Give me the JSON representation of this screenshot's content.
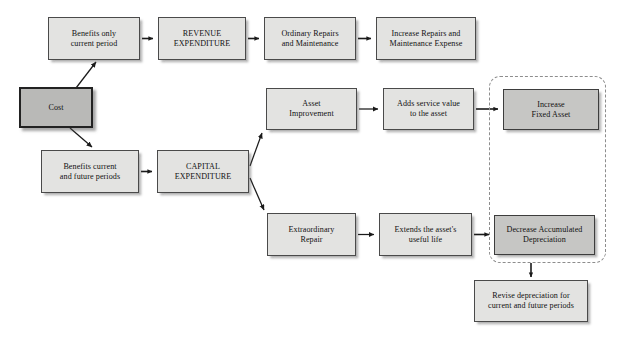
{
  "diagram": {
    "caption_fragment": "",
    "colors": {
      "node_fill": "#e3e3e1",
      "emphasis_fill": "#c6c6c4",
      "root_fill": "#b9b9b7",
      "border": "#4a4a4a",
      "dashed_border": "#8d8d8d",
      "arrow": "#1a1a1a",
      "background": "#ffffff"
    },
    "nodes": [
      {
        "id": "cost",
        "label": "Cost",
        "x": 19,
        "y": 87,
        "w": 74,
        "h": 41,
        "style": "root"
      },
      {
        "id": "benefits-current",
        "label": "Benefits only\ncurrent period",
        "x": 48,
        "y": 17,
        "w": 92,
        "h": 43,
        "style": "normal"
      },
      {
        "id": "revenue-expenditure",
        "label": "REVENUE\nEXPENDITURE",
        "x": 158,
        "y": 17,
        "w": 88,
        "h": 43,
        "style": "normal"
      },
      {
        "id": "ordinary-repairs",
        "label": "Ordinary Repairs\nand Maintenance",
        "x": 264,
        "y": 17,
        "w": 92,
        "h": 43,
        "style": "normal"
      },
      {
        "id": "increase-repairs",
        "label": "Increase Repairs and\nMaintenance Expense",
        "x": 376,
        "y": 17,
        "w": 100,
        "h": 43,
        "style": "normal"
      },
      {
        "id": "benefits-future",
        "label": "Benefits current\nand future periods",
        "x": 41,
        "y": 150,
        "w": 98,
        "h": 43,
        "style": "normal"
      },
      {
        "id": "capital-expenditure",
        "label": "CAPITAL\nEXPENDITURE",
        "x": 157,
        "y": 150,
        "w": 92,
        "h": 43,
        "style": "normal"
      },
      {
        "id": "asset-improvement",
        "label": "Asset\nImprovement",
        "x": 266,
        "y": 88,
        "w": 91,
        "h": 42,
        "style": "normal"
      },
      {
        "id": "adds-service-value",
        "label": "Adds service value\nto the asset",
        "x": 383,
        "y": 88,
        "w": 91,
        "h": 42,
        "style": "normal"
      },
      {
        "id": "increase-fixed-asset",
        "label": "Increase\nFixed Asset",
        "x": 503,
        "y": 89,
        "w": 96,
        "h": 41,
        "style": "emph"
      },
      {
        "id": "extraordinary-repair",
        "label": "Extraordinary\nRepair",
        "x": 267,
        "y": 213,
        "w": 89,
        "h": 43,
        "style": "normal"
      },
      {
        "id": "extends-useful-life",
        "label": "Extends the asset's\nuseful life",
        "x": 379,
        "y": 213,
        "w": 93,
        "h": 43,
        "style": "normal"
      },
      {
        "id": "decrease-accum-dep",
        "label": "Decrease Accumulated\nDepreciation",
        "x": 494,
        "y": 215,
        "w": 101,
        "h": 40,
        "style": "emph"
      },
      {
        "id": "revise-depreciation",
        "label": "Revise depreciation for\ncurrent and future periods",
        "x": 474,
        "y": 280,
        "w": 114,
        "h": 42,
        "style": "normal"
      }
    ],
    "dashed_group": {
      "id": "balance-sheet-group",
      "x": 489,
      "y": 76,
      "w": 117,
      "h": 187
    },
    "edges": [
      {
        "id": "cost-to-benefits-current",
        "from": "cost",
        "to": "benefits-current",
        "type": "diagonal-up"
      },
      {
        "id": "cost-to-benefits-future",
        "from": "cost",
        "to": "benefits-future",
        "type": "diagonal-down"
      },
      {
        "id": "benefits-current-to-revenue",
        "from": "benefits-current",
        "to": "revenue-expenditure",
        "type": "straight-right"
      },
      {
        "id": "revenue-to-ordinary",
        "from": "revenue-expenditure",
        "to": "ordinary-repairs",
        "type": "straight-right"
      },
      {
        "id": "ordinary-to-increase",
        "from": "ordinary-repairs",
        "to": "increase-repairs",
        "type": "straight-right"
      },
      {
        "id": "benefits-future-to-capital",
        "from": "benefits-future",
        "to": "capital-expenditure",
        "type": "straight-right"
      },
      {
        "id": "capital-to-asset-improve",
        "from": "capital-expenditure",
        "to": "asset-improvement",
        "type": "diagonal-up"
      },
      {
        "id": "capital-to-extraordinary",
        "from": "capital-expenditure",
        "to": "extraordinary-repair",
        "type": "diagonal-down"
      },
      {
        "id": "asset-improve-to-adds",
        "from": "asset-improvement",
        "to": "adds-service-value",
        "type": "straight-right"
      },
      {
        "id": "adds-to-increase-fixed",
        "from": "adds-service-value",
        "to": "increase-fixed-asset",
        "type": "straight-right"
      },
      {
        "id": "extraordinary-to-extends",
        "from": "extraordinary-repair",
        "to": "extends-useful-life",
        "type": "straight-right"
      },
      {
        "id": "extends-to-decrease",
        "from": "extends-useful-life",
        "to": "decrease-accum-dep",
        "type": "straight-right"
      },
      {
        "id": "decrease-to-revise",
        "from": "decrease-accum-dep",
        "to": "revise-depreciation",
        "type": "straight-down"
      }
    ]
  }
}
